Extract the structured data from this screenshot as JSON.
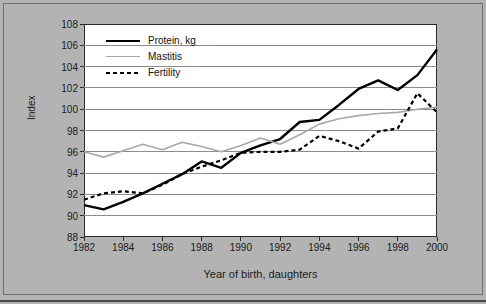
{
  "chart_data": {
    "type": "line",
    "title": "",
    "xlabel": "Year of birth, daughters",
    "ylabel": "Index",
    "xlim": [
      1982,
      2000
    ],
    "ylim": [
      88,
      108
    ],
    "yticks": [
      88,
      90,
      92,
      94,
      96,
      98,
      100,
      102,
      104,
      106,
      108
    ],
    "xticks": [
      1982,
      1984,
      1986,
      1988,
      1990,
      1992,
      1994,
      1996,
      1998,
      2000
    ],
    "grid": "horizontal",
    "legend_position": "top-left",
    "x": [
      1982,
      1983,
      1984,
      1985,
      1986,
      1987,
      1988,
      1989,
      1990,
      1991,
      1992,
      1993,
      1994,
      1995,
      1996,
      1997,
      1998,
      1999,
      2000
    ],
    "series": [
      {
        "name": "Protein, kg",
        "style": "solid",
        "color": "#000000",
        "width": 2.4,
        "values": [
          91.0,
          90.6,
          91.3,
          92.1,
          93.0,
          93.9,
          95.1,
          94.5,
          95.9,
          96.6,
          97.2,
          98.8,
          99.0,
          100.4,
          101.9,
          102.7,
          101.8,
          103.2,
          105.6
        ]
      },
      {
        "name": "Mastitis",
        "style": "solid",
        "color": "#a8a8a8",
        "width": 1.6,
        "values": [
          96.0,
          95.5,
          96.1,
          96.7,
          96.2,
          96.9,
          96.5,
          96.0,
          96.6,
          97.3,
          96.7,
          97.6,
          98.6,
          99.1,
          99.4,
          99.6,
          99.7,
          100.0,
          100.2
        ]
      },
      {
        "name": "Fertility",
        "style": "dashed",
        "color": "#000000",
        "width": 2.2,
        "values": [
          91.5,
          92.1,
          92.3,
          92.1,
          92.9,
          93.9,
          94.6,
          95.2,
          95.9,
          96.0,
          96.0,
          96.2,
          97.5,
          97.0,
          96.3,
          97.9,
          98.2,
          101.5,
          99.7
        ]
      }
    ]
  },
  "legend": {
    "items": [
      {
        "label": "Protein, kg"
      },
      {
        "label": "Mastitis"
      },
      {
        "label": "Fertility"
      }
    ]
  },
  "colors": {
    "background": "#b3b3b3",
    "plot_background": "#ffffff",
    "axis": "#2b2b2b",
    "gridline": "#8c8c8c",
    "protein": "#000000",
    "mastitis": "#a8a8a8",
    "fertility": "#000000"
  }
}
